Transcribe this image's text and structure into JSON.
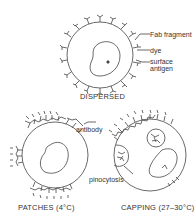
{
  "diagram": {
    "panels": [
      {
        "id": "dispersed",
        "caption": "DISPERSED",
        "labels": [
          "Fab fragment",
          "dye",
          "surface",
          "antigen"
        ]
      },
      {
        "id": "patches",
        "caption": "PATCHES (4°C)",
        "labels": [
          "antibody"
        ]
      },
      {
        "id": "capping",
        "caption": "CAPPING (27–30°C)",
        "labels": [
          "pinocytosis"
        ]
      }
    ],
    "colors": {
      "line": "#444444",
      "background": "#ffffff"
    }
  }
}
